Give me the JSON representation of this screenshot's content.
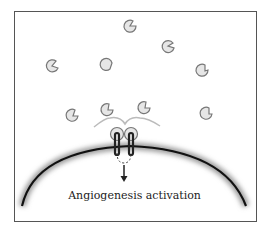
{
  "diagram": {
    "caption": "Angiogenesis activation",
    "colors": {
      "frame": "#555555",
      "ligand_fill": "#e8e8e8",
      "ligand_stroke": "#777777",
      "membrane": "#111111",
      "linker": "#bbbbbb"
    },
    "elements": {
      "free_ligands": 9,
      "bound_ligands": 2,
      "receptors": 2,
      "membrane": "cell membrane arc",
      "arrow": "downward signaling arrow"
    }
  }
}
